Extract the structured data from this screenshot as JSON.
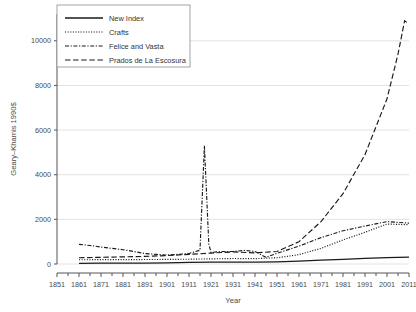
{
  "chart_data": {
    "type": "line",
    "title": "",
    "xlabel": "Year",
    "ylabel": "Geary–Khamis 1990$",
    "xlim": [
      1851,
      2011
    ],
    "ylim": [
      0,
      11200
    ],
    "xticks": [
      1851,
      1861,
      1871,
      1881,
      1891,
      1901,
      1911,
      1921,
      1931,
      1941,
      1951,
      1961,
      1971,
      1981,
      1991,
      2001,
      2011
    ],
    "yticks": [
      0,
      2000,
      4000,
      6000,
      8000,
      10000
    ],
    "grid": "horizontal",
    "legend_position": "top-left",
    "series": [
      {
        "name": "New Index",
        "style": "solid",
        "x": [
          1861,
          1871,
          1881,
          1891,
          1901,
          1911,
          1921,
          1931,
          1941,
          1951,
          1961,
          1971,
          1981,
          1991,
          2001,
          2011
        ],
        "values": [
          30,
          35,
          40,
          45,
          55,
          70,
          80,
          85,
          80,
          95,
          130,
          170,
          210,
          250,
          285,
          305
        ]
      },
      {
        "name": "Crafts",
        "style": "dotted",
        "x": [
          1861,
          1871,
          1881,
          1891,
          1901,
          1911,
          1921,
          1931,
          1941,
          1951,
          1961,
          1971,
          1981,
          1991,
          2001,
          2011
        ],
        "values": [
          190,
          195,
          195,
          200,
          205,
          215,
          230,
          245,
          240,
          280,
          420,
          700,
          1080,
          1420,
          1790,
          1760
        ]
      },
      {
        "name": "Felice and Vasta",
        "style": "dashdot",
        "x": [
          1861,
          1866,
          1871,
          1876,
          1881,
          1886,
          1891,
          1896,
          1901,
          1906,
          1911,
          1916,
          1918,
          1920,
          1921,
          1926,
          1931,
          1936,
          1941,
          1946,
          1951,
          1961,
          1971,
          1981,
          1991,
          2001,
          2011
        ],
        "values": [
          880,
          830,
          760,
          700,
          640,
          560,
          470,
          430,
          400,
          430,
          470,
          620,
          5300,
          900,
          520,
          560,
          560,
          610,
          560,
          300,
          480,
          800,
          1180,
          1490,
          1700,
          1900,
          1830
        ]
      },
      {
        "name": "Prados de La Escosura",
        "style": "longdash",
        "x": [
          1861,
          1871,
          1881,
          1891,
          1901,
          1911,
          1921,
          1931,
          1941,
          1951,
          1961,
          1971,
          1981,
          1991,
          2001,
          2006,
          2009,
          2011
        ],
        "values": [
          280,
          300,
          320,
          340,
          380,
          430,
          490,
          540,
          500,
          560,
          1000,
          1900,
          3150,
          4900,
          7400,
          9400,
          10900,
          10750
        ]
      }
    ],
    "annotations": [
      {
        "text": "spike in Felice and Vasta series",
        "x": 1918,
        "y": 5300
      }
    ]
  },
  "legend": {
    "items": [
      {
        "label": "New Index"
      },
      {
        "label": "Crafts"
      },
      {
        "label": "Felice and Vasta"
      },
      {
        "label": "Prados de La Escosura"
      }
    ]
  },
  "axes": {
    "y_title": "Geary–Khamis 1990$",
    "x_title": "Year",
    "ytick_labels": [
      "0",
      "2000",
      "4000",
      "6000",
      "8000",
      "10000"
    ],
    "xtick_labels": [
      "1851",
      "1861",
      "1871",
      "1881",
      "1891",
      "1901",
      "1911",
      "1921",
      "1931",
      "1941",
      "1951",
      "1961",
      "1971",
      "1981",
      "1991",
      "2001",
      "2011"
    ]
  },
  "colors": {
    "background": "#ffffff",
    "grid": "#e2e2e2",
    "axis": "#555555",
    "line": "#1a1a1a",
    "text": "#4a4a4a"
  }
}
